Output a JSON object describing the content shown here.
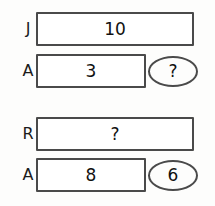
{
  "diagram": {
    "type": "bar-model",
    "groups": [
      {
        "name": "group-1",
        "rows": [
          {
            "label": "J",
            "bar_value": "10",
            "bar_length": "long",
            "bubble": null
          },
          {
            "label": "A",
            "bar_value": "3",
            "bar_length": "short",
            "bubble": "?"
          }
        ]
      },
      {
        "name": "group-2",
        "rows": [
          {
            "label": "R",
            "bar_value": "?",
            "bar_length": "long",
            "bubble": null
          },
          {
            "label": "A",
            "bar_value": "8",
            "bar_length": "short",
            "bubble": "6"
          }
        ]
      }
    ]
  },
  "rows": {
    "j": {
      "label": "J",
      "value": "10"
    },
    "a1": {
      "label": "A",
      "value": "3",
      "bubble": "?"
    },
    "r": {
      "label": "R",
      "value": "?"
    },
    "a2": {
      "label": "A",
      "value": "8",
      "bubble": "6"
    }
  },
  "colors": {
    "background": "#fdfdfc",
    "bar_border": "#4a4a4a",
    "bar_fill": "#ffffff",
    "text": "#111111"
  }
}
